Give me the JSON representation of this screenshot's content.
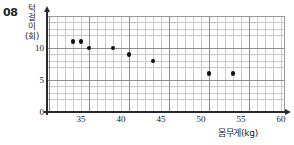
{
  "question_number": "08",
  "chart_data": {
    "type": "scatter",
    "title": "",
    "xlabel": "몸무게(kg)",
    "ylabel": "턱걸이(회)",
    "ylabel_chars": [
      "턱",
      "걸",
      "이",
      "(회)"
    ],
    "xlim": [
      31,
      61
    ],
    "ylim": [
      0,
      15
    ],
    "xticks": [
      35,
      40,
      45,
      50,
      55,
      60
    ],
    "yticks": [
      0,
      5,
      10
    ],
    "xtick_labels": [
      "35",
      "40",
      "45",
      "50",
      "55",
      "60"
    ],
    "ytick_labels": [
      "0",
      "5",
      "10"
    ],
    "x_minor_step": 1,
    "y_minor_step": 1,
    "x_major_step": 5,
    "y_major_step": 5,
    "grid": true,
    "legend": "none",
    "point_color": "#111111",
    "grid_minor_color": "#c9c9c9",
    "grid_major_color": "#8e8e8e",
    "axis_color": "#2a2a2a",
    "x": [
      34,
      35,
      36,
      39,
      41,
      44,
      51,
      54
    ],
    "y": [
      11,
      11,
      10,
      10,
      9,
      8,
      6,
      6
    ],
    "points": [
      {
        "x": 34,
        "y": 11
      },
      {
        "x": 35,
        "y": 11
      },
      {
        "x": 36,
        "y": 10
      },
      {
        "x": 39,
        "y": 10
      },
      {
        "x": 41,
        "y": 9
      },
      {
        "x": 44,
        "y": 8
      },
      {
        "x": 51,
        "y": 6
      },
      {
        "x": 54,
        "y": 6
      }
    ]
  }
}
